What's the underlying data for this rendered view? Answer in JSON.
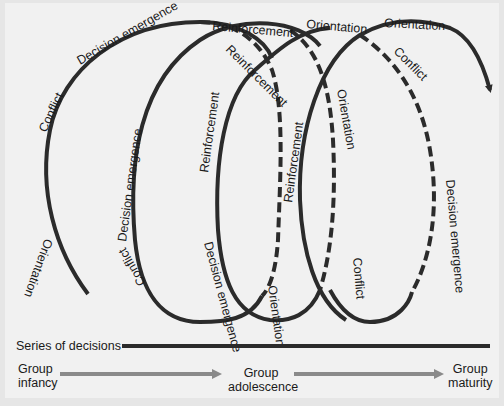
{
  "diagram": {
    "stage_labels": {
      "orientation": "Orientation",
      "conflict": "Conflict",
      "decision_emergence": "Decision emergence",
      "reinforcement": "Reinforcement"
    },
    "loop_labels": [
      {
        "id": "l1",
        "text": "Orientation"
      },
      {
        "id": "l2",
        "text": "Conflict"
      },
      {
        "id": "l3",
        "text": "Decision emergence"
      },
      {
        "id": "l4",
        "text": "Reinforcement"
      },
      {
        "id": "l5",
        "text": "Reinforcement"
      },
      {
        "id": "l6",
        "text": "Orientation"
      },
      {
        "id": "l7",
        "text": "Orientation"
      },
      {
        "id": "l8",
        "text": "Conflict"
      },
      {
        "id": "l9",
        "text": "Decision emergence"
      },
      {
        "id": "l10",
        "text": "Conflict"
      },
      {
        "id": "l11",
        "text": "Decision emergence"
      },
      {
        "id": "l12",
        "text": "Reinforcement"
      },
      {
        "id": "l13",
        "text": "Decision emergence"
      },
      {
        "id": "l14",
        "text": "Orientation"
      },
      {
        "id": "l15",
        "text": "Reinforcement"
      },
      {
        "id": "l16",
        "text": "Orientation"
      },
      {
        "id": "l17",
        "text": "Conflict"
      }
    ],
    "series_label": "Series of decisions",
    "stages": [
      {
        "line1": "Group",
        "line2": "infancy"
      },
      {
        "line1": "Group",
        "line2": "adolescence"
      },
      {
        "line1": "Group",
        "line2": "maturity"
      }
    ],
    "colors": {
      "curve": "#2b2b2b",
      "arrow": "#8a8a8a",
      "background": "#f1f1f1"
    }
  }
}
